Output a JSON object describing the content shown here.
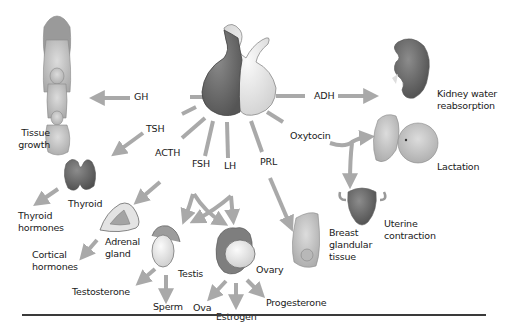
{
  "diagram": {
    "center": "pituitary-gland",
    "colors": {
      "arrow": "#a9a9a9",
      "anterior_lobe": "#6e6e6e",
      "posterior_lobe": "#e6e6e6",
      "text": "#1a1a1a",
      "rule": "#3a3a3a"
    },
    "hormones": {
      "gh": "GH",
      "tsh": "TSH",
      "acth": "ACTH",
      "fsh": "FSH",
      "lh": "LH",
      "prl": "PRL",
      "oxytocin": "Oxytocin",
      "adh": "ADH"
    },
    "targets": {
      "tissue_growth": "Tissue growth",
      "thyroid": "Thyroid",
      "thyroid_hormones": "Thyroid hormones",
      "adrenal_gland": "Adrenal gland",
      "cortical_hormones": "Cortical hormones",
      "testis": "Testis",
      "testosterone": "Testosterone",
      "sperm": "Sperm",
      "ovary": "Ovary",
      "ova": "Ova",
      "estrogen": "Estrogen",
      "progesterone": "Progesterone",
      "breast": "Breast glandular tissue",
      "lactation": "Lactation",
      "uterine": "Uterine contraction",
      "kidney": "Kidney water reabsorption"
    },
    "edges": [
      {
        "from": "pituitary",
        "hormone": "GH",
        "to": "Tissue growth"
      },
      {
        "from": "pituitary",
        "hormone": "TSH",
        "to": "Thyroid"
      },
      {
        "from": "Thyroid",
        "to": "Thyroid hormones"
      },
      {
        "from": "pituitary",
        "hormone": "ACTH",
        "to": "Adrenal gland"
      },
      {
        "from": "Adrenal gland",
        "to": "Cortical hormones"
      },
      {
        "from": "pituitary",
        "hormone": "FSH",
        "to": "Testis"
      },
      {
        "from": "pituitary",
        "hormone": "FSH",
        "to": "Ovary"
      },
      {
        "from": "pituitary",
        "hormone": "LH",
        "to": "Testis"
      },
      {
        "from": "pituitary",
        "hormone": "LH",
        "to": "Ovary"
      },
      {
        "from": "Testis",
        "to": "Testosterone"
      },
      {
        "from": "Testis",
        "to": "Sperm"
      },
      {
        "from": "Ovary",
        "to": "Ova"
      },
      {
        "from": "Ovary",
        "to": "Estrogen"
      },
      {
        "from": "Ovary",
        "to": "Progesterone"
      },
      {
        "from": "pituitary",
        "hormone": "PRL",
        "to": "Breast glandular tissue"
      },
      {
        "from": "pituitary",
        "hormone": "Oxytocin",
        "to": "Lactation"
      },
      {
        "from": "pituitary",
        "hormone": "Oxytocin",
        "to": "Uterine contraction"
      },
      {
        "from": "pituitary",
        "hormone": "ADH",
        "to": "Kidney water reabsorption"
      }
    ]
  }
}
